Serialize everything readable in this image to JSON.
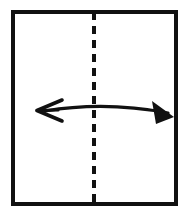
{
  "figure": {
    "background_color": "#ffffff",
    "ink_color": "#111111",
    "width": 195,
    "height": 216
  },
  "paper": {
    "label": "square sheet of paper",
    "shape": "rectangle",
    "stroke_color": "#111111",
    "stroke_width": 4,
    "left": 13,
    "top": 12,
    "right": 176,
    "bottom": 204
  },
  "fold_line": {
    "label": "vertical centre fold line",
    "style": "dashed",
    "stroke_color": "#111111",
    "stroke_width": 4,
    "dash_length": 8,
    "gap_length": 6,
    "x": 94,
    "y_start": 12,
    "y_end": 204
  },
  "arrow": {
    "label": "double-headed fold direction arrow",
    "stroke_color": "#111111",
    "stroke_width": 3,
    "left_tip_x": 37,
    "right_tip_x": 174,
    "baseline_y": 111,
    "curve_peak_y": 104,
    "left_head_style": "open-chevron",
    "right_head_style": "solid-triangle"
  },
  "annotations": {
    "caption": ""
  }
}
